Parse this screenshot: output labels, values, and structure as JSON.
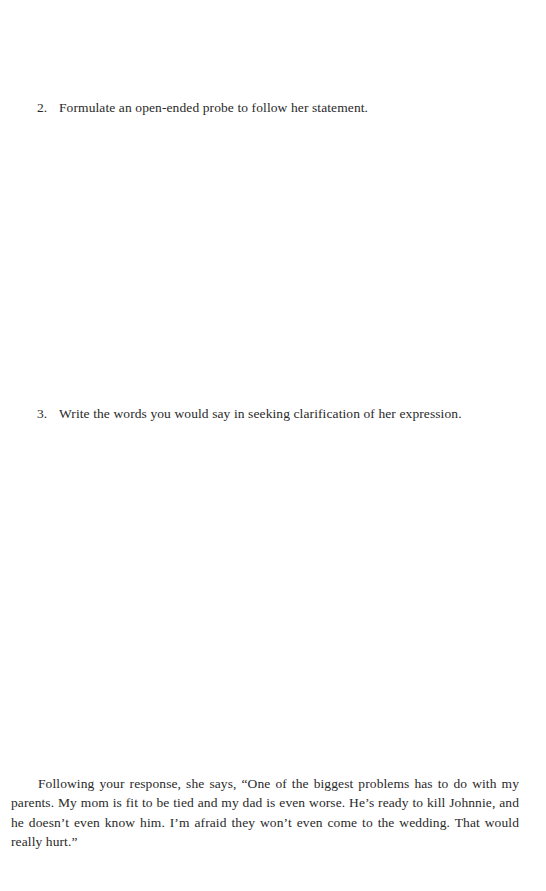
{
  "questions": [
    {
      "number": "2.",
      "text": "Formulate an open-ended probe to follow her statement."
    },
    {
      "number": "3.",
      "text": "Write the words you would say in seeking clarification of her expression."
    }
  ],
  "narrative": {
    "text": "Following your response, she says, “One of the biggest problems has to do with my parents. My mom is fit to be tied and my dad is even worse. He’s ready to kill Johnnie, and he doesn’t even know him. I’m afraid they won’t even come to the wedding. That would really hurt.”"
  }
}
